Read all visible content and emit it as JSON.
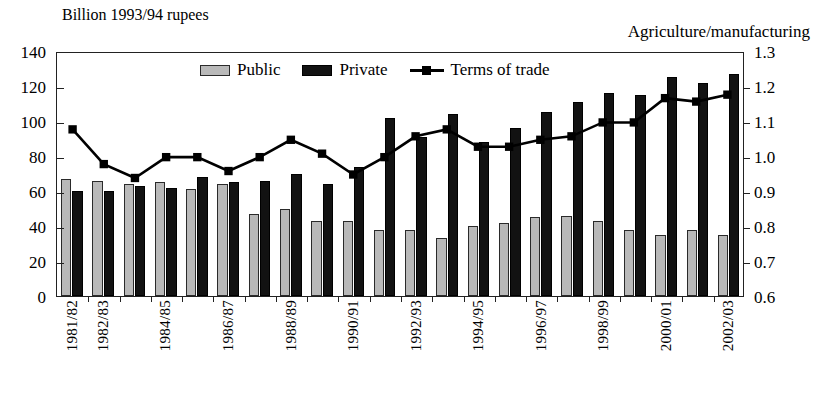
{
  "header": {
    "left_title": "Billion 1993/94 rupees",
    "right_title": "Agriculture/manufacturing"
  },
  "legend": {
    "public_label": "Public",
    "private_label": "Private",
    "terms_label": "Terms of trade"
  },
  "colors": {
    "public": "#b9b9b9",
    "private": "#121212",
    "line": "#000000",
    "axis": "#222222",
    "background": "#ffffff"
  },
  "chart_data": {
    "type": "bar",
    "title": "Billion 1993/94 rupees",
    "subtitle": "Agriculture/manufacturing",
    "xlabel": "",
    "ylabel": "Billion 1993/94 rupees",
    "y2label": "Agriculture/manufacturing",
    "ylim": [
      0,
      140
    ],
    "y2lim": [
      0.6,
      1.3
    ],
    "yticks": [
      "0",
      "20",
      "40",
      "60",
      "80",
      "100",
      "120",
      "140"
    ],
    "y2ticks": [
      "0.6",
      "0.7",
      "0.8",
      "0.9",
      "1.0",
      "1.1",
      "1.2",
      "1.3"
    ],
    "grid": false,
    "legend_position": "top-center",
    "categories": [
      "1981/82",
      "1982/83",
      "1983/84",
      "1984/85",
      "1985/86",
      "1986/87",
      "1987/88",
      "1988/89",
      "1989/90",
      "1990/91",
      "1991/92",
      "1992/93",
      "1993/94",
      "1994/95",
      "1995/96",
      "1996/97",
      "1997/98",
      "1998/99",
      "1999/00",
      "2000/01",
      "2001/02",
      "2002/03"
    ],
    "tick_labels_shown": [
      "1981/82",
      "1982/83",
      "",
      "1984/85",
      "",
      "1986/87",
      "",
      "1988/89",
      "",
      "1990/91",
      "",
      "1992/93",
      "",
      "1994/95",
      "",
      "1996/97",
      "",
      "1998/99",
      "",
      "2000/01",
      "",
      "2002/03"
    ],
    "series": [
      {
        "name": "Public",
        "axis": "left",
        "type": "bar",
        "values": [
          67,
          66,
          64,
          65,
          61,
          64,
          47,
          50,
          43,
          43,
          38,
          38,
          33,
          40,
          42,
          45,
          46,
          43,
          38,
          35,
          38,
          35
        ]
      },
      {
        "name": "Private",
        "axis": "left",
        "type": "bar",
        "values": [
          60,
          60,
          63,
          62,
          68,
          65,
          66,
          70,
          64,
          74,
          102,
          91,
          104,
          88,
          96,
          105,
          111,
          116,
          115,
          125,
          122,
          127
        ]
      },
      {
        "name": "Terms of trade",
        "axis": "right",
        "type": "line",
        "values": [
          1.08,
          0.98,
          0.94,
          1.0,
          1.0,
          0.96,
          1.0,
          1.05,
          1.01,
          0.95,
          1.0,
          1.06,
          1.08,
          1.03,
          1.03,
          1.05,
          1.06,
          1.1,
          1.1,
          1.17,
          1.16,
          1.18
        ]
      }
    ]
  }
}
